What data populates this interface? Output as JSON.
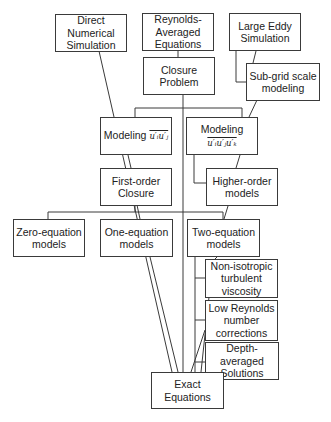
{
  "diagram": {
    "title": "",
    "line_color": "#3a3a3a",
    "box_border_color": "#3a3a3a",
    "nodes": {
      "dns": {
        "label": "Direct Numerical Simulation",
        "lines": [
          "Direct",
          "Numerical",
          "Simulation"
        ]
      },
      "rans": {
        "label": "Reynolds-Averaged Equations",
        "lines": [
          "Reynolds-",
          "Averaged",
          "Equations"
        ]
      },
      "les": {
        "label": "Large Eddy Simulation",
        "lines": [
          "Large Eddy",
          "Simulation"
        ]
      },
      "closure": {
        "label": "Closure Problem",
        "lines": [
          "Closure",
          "Problem"
        ]
      },
      "subgrid": {
        "label": "Sub-grid scale modeling",
        "lines": [
          "Sub-grid scale",
          "modeling"
        ]
      },
      "model2": {
        "label": "Modeling",
        "math": "u′ᵢu′ⱼ"
      },
      "model3": {
        "label": "Modeling",
        "math": "u′ᵢu′ⱼu′ₖ"
      },
      "first_order": {
        "label": "First-order Closure",
        "lines": [
          "First-order",
          "Closure"
        ]
      },
      "higher_order": {
        "label": "Higher-order models",
        "lines": [
          "Higher-order",
          "models"
        ]
      },
      "zero_eq": {
        "label": "Zero-equation models",
        "lines": [
          "Zero-equation",
          "models"
        ]
      },
      "one_eq": {
        "label": "One-equation models",
        "lines": [
          "One-equation",
          "models"
        ]
      },
      "two_eq": {
        "label": "Two-equation models",
        "lines": [
          "Two-equation",
          "models"
        ]
      },
      "non_iso": {
        "label": "Non-isotropic turbulent viscosity",
        "lines": [
          "Non-isotropic",
          "turbulent",
          "viscosity"
        ]
      },
      "low_re": {
        "label": "Low Reynolds number corrections",
        "lines": [
          "Low Reynolds",
          "number",
          "corrections"
        ]
      },
      "depth_avg": {
        "label": "Depth-averaged Solutions",
        "lines": [
          "Depth-averaged",
          "Solutions"
        ]
      },
      "exact": {
        "label": "Exact Equations",
        "lines": [
          "Exact Equations"
        ]
      }
    },
    "edges": [
      [
        "rans",
        "closure"
      ],
      [
        "les",
        "subgrid"
      ],
      [
        "closure",
        "model2"
      ],
      [
        "closure",
        "model3"
      ],
      [
        "closure",
        "exact"
      ],
      [
        "model2",
        "first_order"
      ],
      [
        "model3",
        "higher_order"
      ],
      [
        "subgrid",
        "model3"
      ],
      [
        "first_order",
        "zero_eq"
      ],
      [
        "first_order",
        "one_eq"
      ],
      [
        "first_order",
        "two_eq"
      ],
      [
        "higher_order",
        "two_eq"
      ],
      [
        "two_eq",
        "non_iso"
      ],
      [
        "two_eq",
        "low_re"
      ],
      [
        "two_eq",
        "depth_avg"
      ],
      [
        "dns",
        "exact"
      ],
      [
        "one_eq",
        "exact"
      ],
      [
        "non_iso",
        "exact"
      ],
      [
        "low_re",
        "exact"
      ],
      [
        "depth_avg",
        "exact"
      ]
    ]
  }
}
